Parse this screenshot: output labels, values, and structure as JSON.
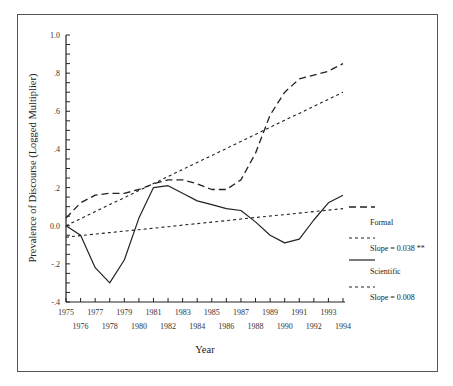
{
  "chart_data": {
    "type": "line",
    "title": "",
    "xlabel": "Year",
    "ylabel": "Prevalence of Discourse (Logged Multiplier)",
    "ylim": [
      -0.4,
      1.0
    ],
    "xlim": [
      1975,
      1994
    ],
    "grid": false,
    "legend_position": "right",
    "x": [
      1975,
      1976,
      1977,
      1978,
      1979,
      1980,
      1981,
      1982,
      1983,
      1984,
      1985,
      1986,
      1987,
      1988,
      1989,
      1990,
      1991,
      1992,
      1993,
      1994
    ],
    "x_tick_labels_top": [
      "1975",
      "1977",
      "1979",
      "1981",
      "1983",
      "1985",
      "1987",
      "1989",
      "1991",
      "1993"
    ],
    "x_tick_labels_bottom": [
      "1976",
      "1978",
      "1980",
      "1982",
      "1984",
      "1986",
      "1988",
      "1990",
      "1992",
      "1994"
    ],
    "y_ticks": [
      1.0,
      0.8,
      0.6,
      0.4,
      0.2,
      0.0,
      -0.2,
      -0.4
    ],
    "y_tick_labels": [
      "1.0",
      ".8",
      ".6",
      ".4",
      ".2",
      "0.0",
      "-.2",
      "-.4"
    ],
    "series": [
      {
        "name": "Formal",
        "style": "long-dash",
        "values": [
          0.04,
          0.12,
          0.16,
          0.17,
          0.17,
          0.19,
          0.22,
          0.24,
          0.24,
          0.22,
          0.19,
          0.19,
          0.24,
          0.38,
          0.58,
          0.7,
          0.77,
          0.79,
          0.81,
          0.85
        ]
      },
      {
        "name": "Formal trend (Slope = 0.038 **)",
        "style": "short-dash",
        "values": [
          0.0,
          0.037,
          0.074,
          0.111,
          0.147,
          0.184,
          0.221,
          0.258,
          0.295,
          0.332,
          0.368,
          0.405,
          0.442,
          0.479,
          0.516,
          0.553,
          0.589,
          0.626,
          0.663,
          0.7
        ]
      },
      {
        "name": "Scientific",
        "style": "solid",
        "values": [
          0.0,
          -0.05,
          -0.22,
          -0.3,
          -0.18,
          0.04,
          0.2,
          0.21,
          0.17,
          0.13,
          0.11,
          0.09,
          0.08,
          0.02,
          -0.05,
          -0.09,
          -0.07,
          0.03,
          0.12,
          0.16
        ]
      },
      {
        "name": "Scientific trend (Slope = 0.008)",
        "style": "short-dash",
        "values": [
          -0.06,
          -0.052,
          -0.044,
          -0.036,
          -0.028,
          -0.021,
          -0.013,
          -0.005,
          0.003,
          0.011,
          0.019,
          0.027,
          0.035,
          0.043,
          0.051,
          0.058,
          0.066,
          0.074,
          0.082,
          0.09
        ]
      }
    ],
    "legend": [
      {
        "label": "",
        "style": "long-dash"
      },
      {
        "label": "Formal",
        "style": "none"
      },
      {
        "label": "",
        "style": "short-dash"
      },
      {
        "label": "Slope = 0.038 **",
        "style": "none"
      },
      {
        "label": "",
        "style": "solid"
      },
      {
        "label": "Scientific",
        "style": "none"
      },
      {
        "label": "",
        "style": "short-dash"
      },
      {
        "label": "Slope = 0.008",
        "style": "none"
      }
    ]
  },
  "labels": {
    "ylabel": "Prevalence of Discourse (Logged Multiplier)",
    "xlabel": "Year",
    "legend_formal": "Formal",
    "legend_formal_slope": "Slope = 0.038 **",
    "legend_scientific": "Scientific",
    "legend_scientific_slope": "Slope = 0.008"
  }
}
